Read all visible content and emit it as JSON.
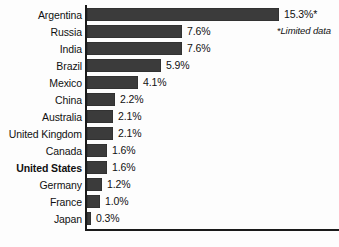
{
  "chart_data": {
    "type": "bar",
    "orientation": "horizontal",
    "title": "",
    "xlabel": "",
    "ylabel": "",
    "xlim": [
      0,
      15.3
    ],
    "grid": false,
    "legend": null,
    "footnote": "*Limited data",
    "categories": [
      "Argentina",
      "Russia",
      "India",
      "Brazil",
      "Mexico",
      "China",
      "Australia",
      "United Kingdom",
      "Canada",
      "United States",
      "Germany",
      "France",
      "Japan"
    ],
    "values": [
      15.3,
      7.6,
      7.6,
      5.9,
      4.1,
      2.2,
      2.1,
      2.1,
      1.6,
      1.6,
      1.2,
      1.0,
      0.3
    ],
    "value_labels": [
      "15.3%*",
      "7.6%",
      "7.6%",
      "5.9%",
      "4.1%",
      "2.2%",
      "2.1%",
      "2.1%",
      "1.6%",
      "1.6%",
      "1.2%",
      "1.0%",
      "0.3%"
    ],
    "highlighted_category": "United States",
    "bar_color": "#3b3b3b",
    "axis_color": "#1a1a1a",
    "text_color": "#111111",
    "background_color": "#fdfdfd",
    "px_per_percent": 12.55
  }
}
